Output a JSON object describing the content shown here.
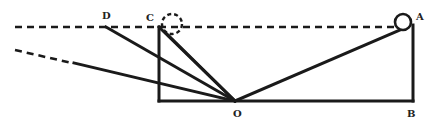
{
  "diagram": {
    "type": "geometry-light-ray-diagram",
    "labels": {
      "A": "A",
      "B": "B",
      "C": "C",
      "D": "D",
      "O": "O"
    },
    "points": {
      "A": [
        413,
        27
      ],
      "B": [
        413,
        101
      ],
      "C": [
        159,
        27
      ],
      "D": [
        106,
        27
      ],
      "O": [
        235,
        101
      ]
    },
    "elements": [
      {
        "kind": "dashed-line",
        "description": "horizontal level line through D, C, A",
        "from": [
          15,
          27
        ],
        "to": [
          396,
          27
        ]
      },
      {
        "kind": "solid-circle",
        "description": "ball at A",
        "center": [
          403,
          22
        ],
        "r": 8
      },
      {
        "kind": "dashed-circle",
        "description": "ball position near C",
        "center": [
          172,
          24
        ],
        "r": 10
      },
      {
        "kind": "solid-line",
        "description": "vertical AB",
        "from": [
          413,
          27
        ],
        "to": [
          413,
          101
        ]
      },
      {
        "kind": "solid-line",
        "description": "base line from C-foot to B",
        "from": [
          159,
          101
        ],
        "to": [
          413,
          101
        ]
      },
      {
        "kind": "solid-line",
        "description": "vertical through C",
        "from": [
          159,
          27
        ],
        "to": [
          159,
          101
        ]
      },
      {
        "kind": "solid-line",
        "description": "O to A",
        "from": [
          235,
          101
        ],
        "to": [
          401,
          30
        ]
      },
      {
        "kind": "solid-line",
        "description": "O to D",
        "from": [
          235,
          101
        ],
        "to": [
          106,
          27
        ]
      },
      {
        "kind": "solid-line",
        "description": "O to C",
        "from": [
          235,
          101
        ],
        "to": [
          159,
          27
        ]
      },
      {
        "kind": "solid-line",
        "description": "O to dashed circle",
        "from": [
          235,
          101
        ],
        "to": [
          166,
          33
        ]
      },
      {
        "kind": "solid-line",
        "description": "O to lower-left ray",
        "from": [
          235,
          101
        ],
        "to": [
          73,
          63
        ]
      },
      {
        "kind": "dashed-line",
        "description": "extension of lower-left ray",
        "from": [
          73,
          63
        ],
        "to": [
          15,
          50
        ]
      }
    ]
  }
}
